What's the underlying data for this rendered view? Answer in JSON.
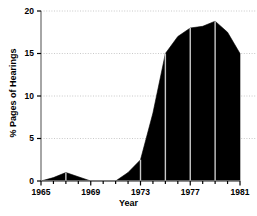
{
  "chart_data": {
    "type": "area",
    "title": "",
    "xlabel": "Year",
    "ylabel": "% Pages of Hearings",
    "xlim": [
      1965,
      1981
    ],
    "ylim": [
      0,
      20
    ],
    "grid": true,
    "grid_axis": "y",
    "legend": false,
    "fill_color": "#000000",
    "line_color": "#000000",
    "gridline_color": "#bbbbbb",
    "axis_color": "#808080",
    "background_color": "#ffffff",
    "marker_line_color": "#c8c8c8",
    "x_ticks": [
      1965,
      1966,
      1967,
      1968,
      1969,
      1970,
      1971,
      1972,
      1973,
      1974,
      1975,
      1976,
      1977,
      1978,
      1979,
      1980,
      1981
    ],
    "x_tick_labels": [
      "1965",
      "",
      "",
      "",
      "1969",
      "",
      "",
      "",
      "1973",
      "",
      "",
      "",
      "1977",
      "",
      "",
      "",
      "1981"
    ],
    "x_major_labels": [
      {
        "value": 1965,
        "label": "1965"
      },
      {
        "value": 1969,
        "label": "1969"
      },
      {
        "value": 1973,
        "label": "1973"
      },
      {
        "value": 1977,
        "label": "1977"
      },
      {
        "value": 1981,
        "label": "1981"
      }
    ],
    "y_ticks": [
      0,
      5,
      10,
      15,
      20
    ],
    "y_tick_labels": [
      "0",
      "5",
      "10",
      "15",
      "20"
    ],
    "x": [
      1965,
      1966,
      1967,
      1968,
      1969,
      1970,
      1971,
      1972,
      1973,
      1974,
      1975,
      1976,
      1977,
      1978,
      1979,
      1980,
      1981
    ],
    "values": [
      0.0,
      0.4,
      1.0,
      0.5,
      0.0,
      0.0,
      0.0,
      1.0,
      2.5,
      8.0,
      15.0,
      17.0,
      18.0,
      18.2,
      18.8,
      17.5,
      15.0
    ],
    "series": [
      {
        "name": "% Pages of Hearings",
        "values": [
          0.0,
          0.4,
          1.0,
          0.5,
          0.0,
          0.0,
          0.0,
          1.0,
          2.5,
          8.0,
          15.0,
          17.0,
          18.0,
          18.2,
          18.8,
          17.5,
          15.0
        ]
      }
    ],
    "interior_marker_years": [
      1967,
      1973,
      1975,
      1977,
      1979
    ]
  }
}
